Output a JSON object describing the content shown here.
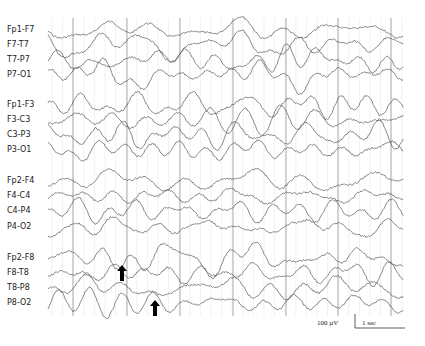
{
  "chart_data": {
    "type": "line",
    "title": "",
    "channels": [
      {
        "label": "Fp1-F7",
        "y": 30,
        "group": 0
      },
      {
        "label": "F7-T7",
        "y": 45,
        "group": 0
      },
      {
        "label": "T7-P7",
        "y": 60,
        "group": 0
      },
      {
        "label": "P7-O1",
        "y": 75,
        "group": 0
      },
      {
        "label": "Fp1-F3",
        "y": 105,
        "group": 1
      },
      {
        "label": "F3-C3",
        "y": 120,
        "group": 1
      },
      {
        "label": "C3-P3",
        "y": 135,
        "group": 1
      },
      {
        "label": "P3-O1",
        "y": 150,
        "group": 1
      },
      {
        "label": "Fp2-F4",
        "y": 181,
        "group": 2
      },
      {
        "label": "F4-C4",
        "y": 196,
        "group": 2
      },
      {
        "label": "C4-P4",
        "y": 211,
        "group": 2
      },
      {
        "label": "P4-O2",
        "y": 227,
        "group": 2
      },
      {
        "label": "Fp2-F8",
        "y": 258,
        "group": 3
      },
      {
        "label": "F8-T8",
        "y": 273,
        "group": 3
      },
      {
        "label": "T8-P8",
        "y": 288,
        "group": 3
      },
      {
        "label": "P8-O2",
        "y": 303,
        "group": 3
      }
    ],
    "x_range_px": [
      48,
      404
    ],
    "second_markers_px": [
      73,
      127,
      180,
      233,
      286,
      338,
      391
    ],
    "minor_grid_step_px": 10.6,
    "annotations": [
      {
        "type": "arrow-up",
        "x": 122,
        "y_tip": 265,
        "channel": "F8-T8"
      },
      {
        "type": "arrow-up",
        "x": 155,
        "y_tip": 300,
        "channel": "P8-O2"
      }
    ],
    "scale_bar": {
      "amplitude_label": "100 µV",
      "time_label": "1 sec"
    },
    "grid": true,
    "legend": null
  },
  "labels": {
    "scale_amplitude": "100 µV",
    "scale_time": "1 sec"
  }
}
